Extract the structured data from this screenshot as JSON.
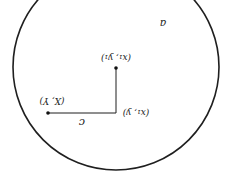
{
  "diagram": {
    "orientation": "rotated-180",
    "colors": {
      "stroke": "#1f1f1f",
      "text": "#222222",
      "background": "#ffffff"
    },
    "circle": {
      "cx": 116,
      "cy": 67,
      "r": 103,
      "label": "a"
    },
    "points": {
      "center": {
        "label": "(x₁, y₁)",
        "x": 116,
        "y": 68
      },
      "corner": {
        "label": "(x₁, y)",
        "x": 116,
        "y": 113
      },
      "outer": {
        "label": "(X, Y)",
        "x": 48,
        "y": 113
      }
    },
    "segments": {
      "horizontal": {
        "label": "c"
      }
    }
  }
}
